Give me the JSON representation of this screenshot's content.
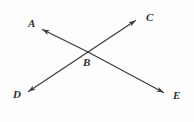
{
  "figure": {
    "background_color": "#fdfdfd",
    "stroke_color": "#3a3a3a",
    "label_color": "#2e2e2e",
    "stroke_width": 1.2,
    "width": 194,
    "height": 122
  },
  "points": {
    "A": {
      "label": "A",
      "x": 28,
      "y": 18
    },
    "B": {
      "label": "B",
      "x": 83,
      "y": 57
    },
    "C": {
      "label": "C",
      "x": 146,
      "y": 12
    },
    "D": {
      "label": "D",
      "x": 13,
      "y": 89
    },
    "E": {
      "label": "E",
      "x": 173,
      "y": 90
    }
  },
  "chart_data": {
    "type": "scatter",
    "xlabel": "",
    "ylabel": "",
    "xlim": [
      0,
      194
    ],
    "ylim": [
      0,
      122
    ],
    "grid": false,
    "legend": "none",
    "annotations": [
      "A",
      "B",
      "C",
      "D",
      "E"
    ],
    "vertices": [
      {
        "name": "A",
        "x": 40,
        "y": 28
      },
      {
        "name": "B",
        "x": 88,
        "y": 52
      },
      {
        "name": "C",
        "x": 138,
        "y": 19
      },
      {
        "name": "D",
        "x": 26,
        "y": 93
      },
      {
        "name": "E",
        "x": 166,
        "y": 94
      }
    ],
    "segments": [
      {
        "name": "line-A-E",
        "from": "A",
        "to": "E",
        "x1": 40,
        "y1": 28,
        "x2": 166,
        "y2": 94,
        "arrow_start": true,
        "arrow_end": true
      },
      {
        "name": "line-D-C",
        "from": "D",
        "to": "C",
        "x1": 26,
        "y1": 93,
        "x2": 138,
        "y2": 19,
        "arrow_start": true,
        "arrow_end": true
      }
    ],
    "intersection": {
      "name": "B",
      "x": 88,
      "y": 52
    }
  }
}
